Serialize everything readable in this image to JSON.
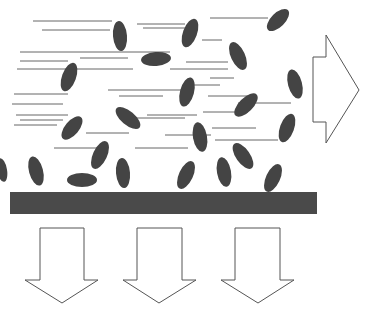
{
  "diagram": {
    "title": "",
    "colors": {
      "particle": "#444444",
      "streak": "#666666",
      "surface": "#4a4a4a",
      "arrow_stroke": "#555555",
      "arrow_fill": "#ffffff",
      "background": "#ffffff"
    },
    "flow_arrow": {
      "direction": "right",
      "points": "313,57 326,57 326,35 359,90 326,143 326,122 313,122"
    },
    "surface": {
      "x": 10,
      "y": 192,
      "width": 307,
      "height": 22
    },
    "down_arrows": [
      {
        "points": "40,228 84,228 84,280 98,280 62,303 25,280 40,280"
      },
      {
        "points": "137,228 182,228 182,280 196,280 159,303 123,280 137,280"
      },
      {
        "points": "235,228 280,228 280,280 294,280 258,303 221,280 235,280"
      }
    ],
    "streaks": [
      [
        33,
        21,
        112,
        21
      ],
      [
        42,
        30,
        110,
        30
      ],
      [
        137,
        24,
        185,
        24
      ],
      [
        143,
        28,
        185,
        28
      ],
      [
        20,
        52,
        170,
        52
      ],
      [
        20,
        61,
        68,
        61
      ],
      [
        80,
        58,
        128,
        58
      ],
      [
        17,
        69,
        133,
        69
      ],
      [
        170,
        69,
        228,
        69
      ],
      [
        210,
        18,
        268,
        18
      ],
      [
        202,
        40,
        222,
        40
      ],
      [
        186,
        62,
        228,
        62
      ],
      [
        14,
        94,
        68,
        94
      ],
      [
        108,
        90,
        183,
        90
      ],
      [
        186,
        85,
        220,
        85
      ],
      [
        210,
        78,
        234,
        78
      ],
      [
        12,
        104,
        63,
        104
      ],
      [
        119,
        96,
        163,
        96
      ],
      [
        208,
        96,
        255,
        96
      ],
      [
        238,
        103,
        291,
        103
      ],
      [
        16,
        115,
        68,
        115
      ],
      [
        20,
        120,
        63,
        120
      ],
      [
        147,
        115,
        197,
        115
      ],
      [
        203,
        112,
        248,
        112
      ],
      [
        14,
        125,
        57,
        125
      ],
      [
        86,
        133,
        129,
        133
      ],
      [
        165,
        135,
        211,
        135
      ],
      [
        212,
        128,
        256,
        128
      ],
      [
        54,
        148,
        99,
        148
      ],
      [
        135,
        148,
        188,
        148
      ],
      [
        130,
        118,
        185,
        118
      ],
      [
        215,
        140,
        278,
        140
      ]
    ],
    "particles": [
      {
        "cx": 120,
        "cy": 36,
        "rx": 7,
        "ry": 15,
        "rot": -5
      },
      {
        "cx": 156,
        "cy": 59,
        "rx": 15,
        "ry": 7,
        "rot": -5
      },
      {
        "cx": 190,
        "cy": 33,
        "rx": 7,
        "ry": 15,
        "rot": 20
      },
      {
        "cx": 278,
        "cy": 20,
        "rx": 7,
        "ry": 14,
        "rot": 45
      },
      {
        "cx": 238,
        "cy": 56,
        "rx": 7,
        "ry": 15,
        "rot": -25
      },
      {
        "cx": 69,
        "cy": 77,
        "rx": 7,
        "ry": 15,
        "rot": 20
      },
      {
        "cx": 187,
        "cy": 92,
        "rx": 7,
        "ry": 15,
        "rot": 15
      },
      {
        "cx": 295,
        "cy": 84,
        "rx": 7,
        "ry": 15,
        "rot": -15
      },
      {
        "cx": 128,
        "cy": 118,
        "rx": 7,
        "ry": 15,
        "rot": -50
      },
      {
        "cx": 246,
        "cy": 105,
        "rx": 7,
        "ry": 15,
        "rot": 45
      },
      {
        "cx": 72,
        "cy": 128,
        "rx": 7,
        "ry": 14,
        "rot": 40
      },
      {
        "cx": 200,
        "cy": 137,
        "rx": 7,
        "ry": 15,
        "rot": -10
      },
      {
        "cx": 287,
        "cy": 128,
        "rx": 7,
        "ry": 15,
        "rot": 20
      },
      {
        "cx": 100,
        "cy": 155,
        "rx": 7,
        "ry": 15,
        "rot": 25
      },
      {
        "cx": 36,
        "cy": 171,
        "rx": 7,
        "ry": 15,
        "rot": -15
      },
      {
        "cx": 82,
        "cy": 180,
        "rx": 15,
        "ry": 7,
        "rot": 0
      },
      {
        "cx": 123,
        "cy": 173,
        "rx": 7,
        "ry": 15,
        "rot": -5
      },
      {
        "cx": 186,
        "cy": 175,
        "rx": 7,
        "ry": 15,
        "rot": 25
      },
      {
        "cx": 224,
        "cy": 172,
        "rx": 7,
        "ry": 15,
        "rot": -10
      },
      {
        "cx": 243,
        "cy": 156,
        "rx": 7,
        "ry": 15,
        "rot": -35
      },
      {
        "cx": 273,
        "cy": 178,
        "rx": 7,
        "ry": 15,
        "rot": 25
      },
      {
        "cx": 2,
        "cy": 170,
        "rx": 5,
        "ry": 12,
        "rot": -10
      }
    ]
  }
}
